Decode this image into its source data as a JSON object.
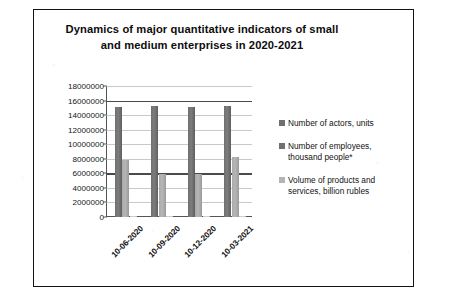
{
  "chart_data": {
    "type": "bar",
    "title": "Dynamics of major quantitative indicators of small and medium enterprises in 2020-2021",
    "title_line1": "Dynamics of major quantitative indicators of small",
    "title_line2": "and medium enterprises in 2020-2021",
    "xlabel": "",
    "ylabel": "",
    "ylim": [
      0,
      18000000
    ],
    "ytick_step": 2000000,
    "yticks": [
      "18000000",
      "16000000",
      "14000000",
      "12000000",
      "10000000",
      "8000000",
      "6000000",
      "4000000",
      "2000000",
      "0"
    ],
    "ytick_values": [
      18000000,
      16000000,
      14000000,
      12000000,
      10000000,
      8000000,
      6000000,
      4000000,
      2000000,
      0
    ],
    "categories": [
      "10-06-2020",
      "10-09-2020",
      "10-12-2020",
      "10-03-2021"
    ],
    "grid": true,
    "legend_position": "right",
    "series": [
      {
        "name": "Number of actors, units",
        "color": "#6f6f6f",
        "values": [
          15100000,
          15200000,
          15150000,
          15250000
        ]
      },
      {
        "name": "Number of employees, thousand people*",
        "color": "#b4b4b4",
        "values": [
          7900000,
          5900000,
          5950000,
          8300000
        ]
      },
      {
        "name": "Volume of products and services, billion rubles",
        "color": "#cfcfcf",
        "values": [
          60000,
          55000,
          58000,
          62000
        ]
      }
    ],
    "legend": [
      "Number of actors, units",
      "Number of employees, thousand people*",
      "Volume of products and services, billion rubles"
    ],
    "legend_lines": [
      [
        "Number of actors, units"
      ],
      [
        "Number of employees,",
        "thousand people*"
      ],
      [
        "Volume of products and",
        "services, billion rubles"
      ]
    ]
  }
}
